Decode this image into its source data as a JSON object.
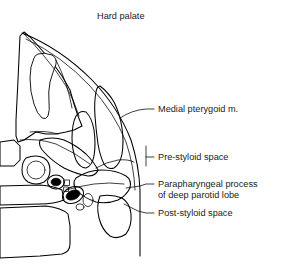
{
  "figure": {
    "title": "Hard palate",
    "background_color": "#ffffff",
    "ink_color": "#000000",
    "width": 285,
    "height": 270,
    "labels": [
      {
        "id": "hard-palate",
        "text": "Hard palate",
        "x": 97,
        "y": 19
      },
      {
        "id": "medial-pterygoid",
        "text": "Medial pterygoid m.",
        "x": 158,
        "y": 112
      },
      {
        "id": "pre-styloid-space",
        "text": "Pre-styloid space",
        "x": 158,
        "y": 160
      },
      {
        "id": "parapharyngeal-process-line1",
        "text": "Parapharyngeal process",
        "x": 158,
        "y": 187
      },
      {
        "id": "parapharyngeal-process-line2",
        "text": "of deep parotid lobe",
        "x": 158,
        "y": 198
      },
      {
        "id": "post-styloid-space",
        "text": "Post-styloid space",
        "x": 158,
        "y": 216
      }
    ],
    "structures": [
      {
        "id": "maxillary-bone",
        "name": "maxillary bone with stipple texture"
      },
      {
        "id": "maxillary-sinus",
        "name": "maxillary sinus cavity"
      },
      {
        "id": "medial-pterygoid-muscle",
        "name": "medial pterygoid muscle, cross-hatched"
      },
      {
        "id": "lateral-pterygoid-muscle",
        "name": "lateral pterygoid muscle, cross-hatched"
      },
      {
        "id": "parotid-process",
        "name": "parapharyngeal process of deep parotid lobe, hatched"
      },
      {
        "id": "carotid-artery",
        "name": "carotid artery, solid fill"
      },
      {
        "id": "jugular-vein",
        "name": "jugular vein, solid fill"
      },
      {
        "id": "vertebral-body",
        "name": "vertebral body with stipple texture"
      },
      {
        "id": "pharyngeal-wall",
        "name": "pharyngeal wall curved outline"
      }
    ]
  }
}
